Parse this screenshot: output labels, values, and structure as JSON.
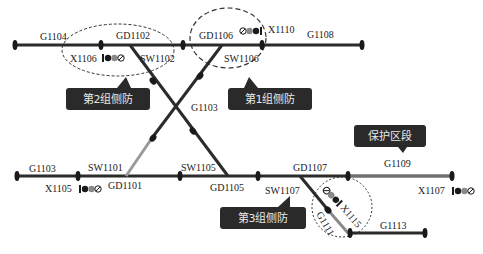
{
  "colors": {
    "track": "#2b2b2b",
    "protected_track": "#8a8a8a",
    "callout_bg": "#2a2a2a",
    "callout_text": "#e8e8e8",
    "dashed_ring": "#333333"
  },
  "tracks": {
    "top": {
      "sections": [
        "G1104",
        "GD1102",
        "GD1106",
        "G1108"
      ]
    },
    "bottom": {
      "sections": [
        "G1103",
        "GD1101",
        "GD1105",
        "GD1107",
        "G1109"
      ]
    },
    "crossover": {
      "section": "G1103"
    },
    "spur": {
      "section": "G1113",
      "branch": "G1111"
    }
  },
  "labels": {
    "g1104": "G1104",
    "gd1102": "GD1102",
    "gd1106": "GD1106",
    "g1108": "G1108",
    "x1106": "X1106",
    "sw1102": "SW1102",
    "sw1106": "SW1106",
    "x1110": "X1110",
    "g1103_mid": "G1103",
    "g1103": "G1103",
    "sw1101": "SW1101",
    "gd1101": "GD1101",
    "x1105": "X1105",
    "sw1105": "SW1105",
    "gd1105": "GD1105",
    "gd1107": "GD1107",
    "sw1107": "SW1107",
    "g1109": "G1109",
    "x1107": "X1107",
    "x1115": "X1115",
    "g1111": "G1111",
    "g1113": "G1113"
  },
  "callouts": {
    "group2": "第2组侧防",
    "group1": "第1组侧防",
    "group3": "第3组侧防",
    "protect": "保护区段"
  }
}
